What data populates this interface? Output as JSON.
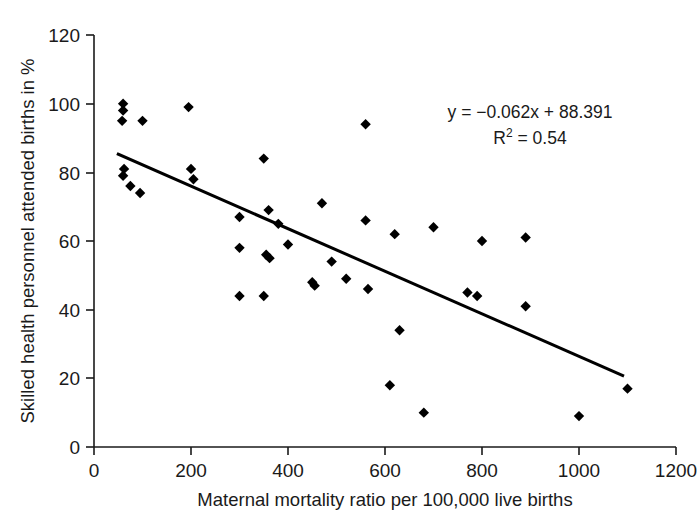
{
  "chart_data": {
    "type": "scatter",
    "title": "",
    "xlabel": "Maternal mortality ratio per 100,000 live births",
    "ylabel": "Skilled health personnel attended births in %",
    "xlim": [
      0,
      1200
    ],
    "ylim": [
      0,
      120
    ],
    "xticks": [
      0,
      200,
      400,
      600,
      800,
      1000,
      1200
    ],
    "yticks": [
      0,
      20,
      40,
      60,
      80,
      100,
      120
    ],
    "xtick_labels": [
      "0",
      "200",
      "400",
      "600",
      "800",
      "1000",
      "1200"
    ],
    "ytick_labels": [
      "0",
      "20",
      "40",
      "60",
      "80",
      "100",
      "120"
    ],
    "grid": false,
    "legend": false,
    "marker": "diamond",
    "marker_color": "#000000",
    "points": [
      {
        "x": 60,
        "y": 100
      },
      {
        "x": 60,
        "y": 98
      },
      {
        "x": 58,
        "y": 95
      },
      {
        "x": 100,
        "y": 95
      },
      {
        "x": 195,
        "y": 99
      },
      {
        "x": 62,
        "y": 81
      },
      {
        "x": 60,
        "y": 79
      },
      {
        "x": 75,
        "y": 76
      },
      {
        "x": 95,
        "y": 74
      },
      {
        "x": 200,
        "y": 81
      },
      {
        "x": 205,
        "y": 78
      },
      {
        "x": 350,
        "y": 84
      },
      {
        "x": 560,
        "y": 94
      },
      {
        "x": 300,
        "y": 67
      },
      {
        "x": 360,
        "y": 69
      },
      {
        "x": 380,
        "y": 65
      },
      {
        "x": 470,
        "y": 71
      },
      {
        "x": 560,
        "y": 66
      },
      {
        "x": 620,
        "y": 62
      },
      {
        "x": 700,
        "y": 64
      },
      {
        "x": 800,
        "y": 60
      },
      {
        "x": 890,
        "y": 61
      },
      {
        "x": 300,
        "y": 58
      },
      {
        "x": 355,
        "y": 56
      },
      {
        "x": 362,
        "y": 55
      },
      {
        "x": 400,
        "y": 59
      },
      {
        "x": 450,
        "y": 48
      },
      {
        "x": 455,
        "y": 47
      },
      {
        "x": 490,
        "y": 54
      },
      {
        "x": 520,
        "y": 49
      },
      {
        "x": 770,
        "y": 45
      },
      {
        "x": 790,
        "y": 44
      },
      {
        "x": 890,
        "y": 41
      },
      {
        "x": 300,
        "y": 44
      },
      {
        "x": 350,
        "y": 44
      },
      {
        "x": 565,
        "y": 46
      },
      {
        "x": 630,
        "y": 34
      },
      {
        "x": 610,
        "y": 18
      },
      {
        "x": 680,
        "y": 10
      },
      {
        "x": 1000,
        "y": 9
      },
      {
        "x": 1100,
        "y": 17
      }
    ],
    "trendline": {
      "equation": "y = −0.062x + 88.391",
      "r_squared_label": "R",
      "r_squared_sup": "2",
      "r_squared_value": " = 0.54",
      "slope": -0.062,
      "intercept": 88.391,
      "r2": 0.54,
      "x_start": 50,
      "x_end": 1090,
      "color": "#000000"
    },
    "annotations": [
      "y = −0.062x + 88.391",
      "R² = 0.54"
    ]
  }
}
